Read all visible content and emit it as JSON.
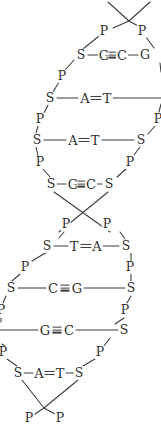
{
  "diagram": {
    "type": "dna-double-helix",
    "colors": {
      "stroke": "#3a3a3a",
      "text": "#2e2e2e",
      "background": "#ffffff"
    },
    "legend": {
      "S": "sugar (deoxyribose)",
      "P": "phosphate",
      "A": "adenine",
      "T": "thymine",
      "G": "guanine",
      "C": "cytosine"
    },
    "symbols": {
      "sugar": "S",
      "phosphate": "P",
      "adenine": "A",
      "thymine": "T",
      "guanine": "G",
      "cytosine": "C"
    },
    "rungs": [
      {
        "y": 55,
        "left_sugar": "S",
        "left_base": "G",
        "bonds": 3,
        "right_base": "C",
        "right_sugar": "G",
        "left_clipped": false,
        "right_clipped": true
      },
      {
        "y": 98,
        "left_sugar": "S",
        "left_base": "A",
        "bonds": 2,
        "right_base": "T",
        "right_sugar": "",
        "left_clipped": false,
        "right_clipped": true
      },
      {
        "y": 140,
        "left_sugar": "S",
        "left_base": "A",
        "bonds": 2,
        "right_base": "T",
        "right_sugar": "S",
        "left_clipped": false,
        "right_clipped": false
      },
      {
        "y": 184,
        "left_sugar": "S",
        "left_base": "G",
        "bonds": 3,
        "right_base": "C",
        "right_sugar": "S",
        "left_clipped": false,
        "right_clipped": false
      },
      {
        "y": 246,
        "left_sugar": "S",
        "left_base": "T",
        "bonds": 2,
        "right_base": "A",
        "right_sugar": "S",
        "left_clipped": false,
        "right_clipped": false
      },
      {
        "y": 288,
        "left_sugar": "S",
        "left_base": "C",
        "bonds": 3,
        "right_base": "G",
        "right_sugar": "S",
        "left_clipped": false,
        "right_clipped": false
      },
      {
        "y": 330,
        "left_sugar": "",
        "left_base": "G",
        "bonds": 3,
        "right_base": "C",
        "right_sugar": "S",
        "left_clipped": true,
        "right_clipped": false
      },
      {
        "y": 373,
        "left_sugar": "S",
        "left_base": "A",
        "bonds": 2,
        "right_base": "T",
        "right_sugar": "S",
        "left_clipped": false,
        "right_clipped": false
      }
    ],
    "phosphates": [
      {
        "id": "p-top-left",
        "label": "P",
        "x": 104,
        "y": 31
      },
      {
        "id": "p-top-right",
        "label": "P",
        "x": 142,
        "y": 31
      },
      {
        "id": "p-l1",
        "label": "P",
        "x": 62,
        "y": 76
      },
      {
        "id": "p-l2",
        "label": "P",
        "x": 40,
        "y": 119
      },
      {
        "id": "p-r2",
        "label": "P",
        "x": 158,
        "y": 119
      },
      {
        "id": "p-l3",
        "label": "P",
        "x": 40,
        "y": 162
      },
      {
        "id": "p-r3",
        "label": "P",
        "x": 130,
        "y": 162
      },
      {
        "id": "p-l4",
        "label": "P",
        "x": 66,
        "y": 224
      },
      {
        "id": "p-r4",
        "label": "P",
        "x": 107,
        "y": 224
      },
      {
        "id": "p-l5",
        "label": "P",
        "x": 25,
        "y": 267
      },
      {
        "id": "p-r5",
        "label": "P",
        "x": 130,
        "y": 267
      },
      {
        "id": "p-l6",
        "label": "P",
        "x": 1,
        "y": 310
      },
      {
        "id": "p-r6",
        "label": "P",
        "x": 125,
        "y": 310
      },
      {
        "id": "p-l7",
        "label": "P",
        "x": 3,
        "y": 352
      },
      {
        "id": "p-r7",
        "label": "P",
        "x": 100,
        "y": 352
      },
      {
        "id": "p-bottom-left",
        "label": "P",
        "x": 29,
        "y": 418
      },
      {
        "id": "p-bottom-right",
        "label": "P",
        "x": 60,
        "y": 418
      }
    ]
  }
}
